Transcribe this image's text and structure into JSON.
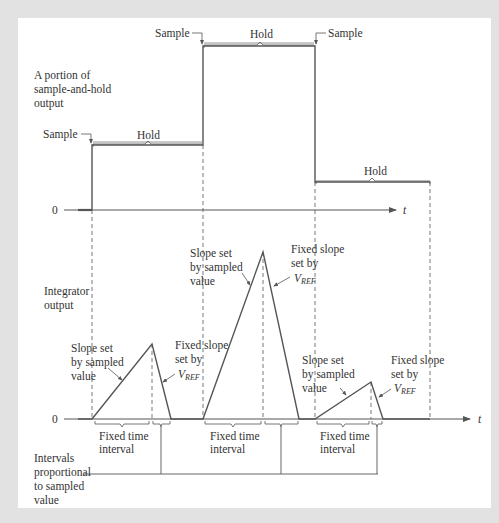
{
  "diagram": {
    "type": "timing-diagram",
    "colors": {
      "background": "#e2e2e2",
      "panel": "#ffffff",
      "line": "#555555",
      "text": "#333333"
    },
    "top_plot": {
      "label_lines": [
        "A portion of",
        "sample-and-hold",
        "output"
      ],
      "zero_label": "0",
      "axis_label": "t",
      "sample_labels": [
        "Sample",
        "Sample",
        "Sample"
      ],
      "hold_labels": [
        "Hold",
        "Hold",
        "Hold"
      ],
      "steps": [
        {
          "x_start": 92,
          "x_end": 203,
          "level": "medium"
        },
        {
          "x_start": 203,
          "x_end": 315,
          "level": "high"
        },
        {
          "x_start": 315,
          "x_end": 430,
          "level": "low"
        }
      ]
    },
    "bottom_plot": {
      "label_lines": [
        "Integrator",
        "output"
      ],
      "zero_label": "0",
      "axis_label": "t",
      "slope_sampled_lines": [
        "Slope set",
        "by sampled",
        "value"
      ],
      "fixed_slope_lines": [
        "Fixed slope",
        "set by"
      ],
      "vref_main": "V",
      "vref_sub": "REF",
      "fixed_interval_lines": [
        "Fixed time",
        "interval"
      ],
      "triangles": [
        {
          "start": 92,
          "peak": 152,
          "end": 171,
          "peak_height": "medium"
        },
        {
          "start": 203,
          "peak": 263,
          "end": 299,
          "peak_height": "high"
        },
        {
          "start": 315,
          "peak": 371,
          "end": 383,
          "peak_height": "low"
        }
      ]
    },
    "proportional_label_lines": [
      "Intervals",
      "proportional",
      "to sampled",
      "value"
    ]
  }
}
